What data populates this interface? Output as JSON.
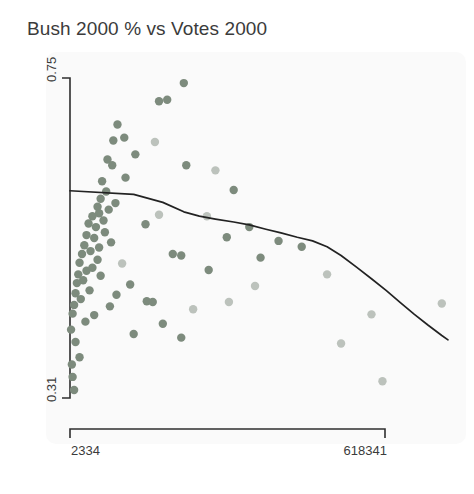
{
  "chart_data": {
    "type": "scatter",
    "title": "Bush 2000 % vs Votes 2000",
    "xlabel": "",
    "ylabel": "",
    "grid": false,
    "legend": false,
    "xlim": [
      2334,
      618341
    ],
    "ylim": [
      0.31,
      0.75
    ],
    "x_tick_labels": [
      "2334",
      "618341"
    ],
    "y_tick_labels": [
      "0.31",
      "0.75"
    ],
    "x_ticks": [
      2334,
      618341
    ],
    "y_ticks": [
      0.31,
      0.75
    ],
    "axis_color": "#2f2f2f",
    "background_color": "#fafafa",
    "point_colors": {
      "dark": "#7d8b7d",
      "light": "#bcc2bc"
    },
    "trend_line": {
      "name": "smoothed trend",
      "color": "#222222",
      "points": [
        [
          2334,
          0.595
        ],
        [
          12000,
          0.59
        ],
        [
          24000,
          0.579
        ],
        [
          38000,
          0.566
        ],
        [
          52000,
          0.56
        ],
        [
          70000,
          0.556
        ],
        [
          95000,
          0.552
        ],
        [
          120000,
          0.548
        ],
        [
          150000,
          0.542
        ],
        [
          180000,
          0.537
        ],
        [
          215000,
          0.531
        ],
        [
          250000,
          0.526
        ],
        [
          285000,
          0.518
        ],
        [
          320000,
          0.506
        ],
        [
          360000,
          0.49
        ],
        [
          400000,
          0.474
        ],
        [
          440000,
          0.458
        ],
        [
          480000,
          0.441
        ],
        [
          520000,
          0.425
        ],
        [
          560000,
          0.41
        ],
        [
          600000,
          0.396
        ],
        [
          618341,
          0.39
        ]
      ]
    },
    "series": [
      {
        "name": "counties",
        "points": [
          {
            "x": 38000,
            "y": 0.743,
            "shade": "dark"
          },
          {
            "x": 22000,
            "y": 0.718,
            "shade": "dark"
          },
          {
            "x": 26500,
            "y": 0.72,
            "shade": "dark"
          },
          {
            "x": 8000,
            "y": 0.686,
            "shade": "dark"
          },
          {
            "x": 9500,
            "y": 0.668,
            "shade": "dark"
          },
          {
            "x": 7200,
            "y": 0.664,
            "shade": "dark"
          },
          {
            "x": 20000,
            "y": 0.662,
            "shade": "light"
          },
          {
            "x": 12500,
            "y": 0.645,
            "shade": "dark"
          },
          {
            "x": 6200,
            "y": 0.638,
            "shade": "dark"
          },
          {
            "x": 7000,
            "y": 0.63,
            "shade": "dark"
          },
          {
            "x": 40000,
            "y": 0.63,
            "shade": "dark"
          },
          {
            "x": 70000,
            "y": 0.623,
            "shade": "light"
          },
          {
            "x": 9800,
            "y": 0.613,
            "shade": "dark"
          },
          {
            "x": 5400,
            "y": 0.608,
            "shade": "dark"
          },
          {
            "x": 95000,
            "y": 0.596,
            "shade": "dark"
          },
          {
            "x": 6000,
            "y": 0.594,
            "shade": "dark"
          },
          {
            "x": 5200,
            "y": 0.584,
            "shade": "dark"
          },
          {
            "x": 7600,
            "y": 0.578,
            "shade": "dark"
          },
          {
            "x": 4800,
            "y": 0.573,
            "shade": "dark"
          },
          {
            "x": 6400,
            "y": 0.569,
            "shade": "dark"
          },
          {
            "x": 5000,
            "y": 0.564,
            "shade": "dark"
          },
          {
            "x": 4200,
            "y": 0.56,
            "shade": "dark"
          },
          {
            "x": 22000,
            "y": 0.562,
            "shade": "light"
          },
          {
            "x": 60000,
            "y": 0.56,
            "shade": "light"
          },
          {
            "x": 5600,
            "y": 0.554,
            "shade": "dark"
          },
          {
            "x": 3800,
            "y": 0.55,
            "shade": "dark"
          },
          {
            "x": 16000,
            "y": 0.549,
            "shade": "dark"
          },
          {
            "x": 4600,
            "y": 0.545,
            "shade": "dark"
          },
          {
            "x": 120000,
            "y": 0.545,
            "shade": "dark"
          },
          {
            "x": 5800,
            "y": 0.538,
            "shade": "dark"
          },
          {
            "x": 3600,
            "y": 0.534,
            "shade": "dark"
          },
          {
            "x": 4400,
            "y": 0.53,
            "shade": "dark"
          },
          {
            "x": 85000,
            "y": 0.531,
            "shade": "dark"
          },
          {
            "x": 175000,
            "y": 0.526,
            "shade": "dark"
          },
          {
            "x": 6800,
            "y": 0.524,
            "shade": "dark"
          },
          {
            "x": 3400,
            "y": 0.52,
            "shade": "dark"
          },
          {
            "x": 5000,
            "y": 0.517,
            "shade": "dark"
          },
          {
            "x": 225000,
            "y": 0.518,
            "shade": "dark"
          },
          {
            "x": 4000,
            "y": 0.512,
            "shade": "dark"
          },
          {
            "x": 3200,
            "y": 0.508,
            "shade": "dark"
          },
          {
            "x": 30000,
            "y": 0.508,
            "shade": "dark"
          },
          {
            "x": 36000,
            "y": 0.506,
            "shade": "dark"
          },
          {
            "x": 140000,
            "y": 0.503,
            "shade": "dark"
          },
          {
            "x": 4800,
            "y": 0.5,
            "shade": "dark"
          },
          {
            "x": 3000,
            "y": 0.496,
            "shade": "dark"
          },
          {
            "x": 9000,
            "y": 0.495,
            "shade": "light"
          },
          {
            "x": 4200,
            "y": 0.489,
            "shade": "dark"
          },
          {
            "x": 3600,
            "y": 0.485,
            "shade": "dark"
          },
          {
            "x": 62000,
            "y": 0.486,
            "shade": "dark"
          },
          {
            "x": 2900,
            "y": 0.48,
            "shade": "dark"
          },
          {
            "x": 5200,
            "y": 0.478,
            "shade": "dark"
          },
          {
            "x": 285000,
            "y": 0.48,
            "shade": "light"
          },
          {
            "x": 3300,
            "y": 0.472,
            "shade": "dark"
          },
          {
            "x": 2800,
            "y": 0.468,
            "shade": "dark"
          },
          {
            "x": 11000,
            "y": 0.466,
            "shade": "dark"
          },
          {
            "x": 130000,
            "y": 0.464,
            "shade": "light"
          },
          {
            "x": 3900,
            "y": 0.458,
            "shade": "dark"
          },
          {
            "x": 2700,
            "y": 0.454,
            "shade": "dark"
          },
          {
            "x": 7800,
            "y": 0.452,
            "shade": "dark"
          },
          {
            "x": 3100,
            "y": 0.446,
            "shade": "dark"
          },
          {
            "x": 16500,
            "y": 0.443,
            "shade": "dark"
          },
          {
            "x": 19000,
            "y": 0.442,
            "shade": "dark"
          },
          {
            "x": 2600,
            "y": 0.438,
            "shade": "dark"
          },
          {
            "x": 6600,
            "y": 0.436,
            "shade": "dark"
          },
          {
            "x": 88000,
            "y": 0.442,
            "shade": "light"
          },
          {
            "x": 600000,
            "y": 0.44,
            "shade": "light"
          },
          {
            "x": 46000,
            "y": 0.432,
            "shade": "light"
          },
          {
            "x": 2500,
            "y": 0.426,
            "shade": "dark"
          },
          {
            "x": 4400,
            "y": 0.424,
            "shade": "dark"
          },
          {
            "x": 400000,
            "y": 0.425,
            "shade": "light"
          },
          {
            "x": 3500,
            "y": 0.415,
            "shade": "dark"
          },
          {
            "x": 24000,
            "y": 0.412,
            "shade": "dark"
          },
          {
            "x": 2400,
            "y": 0.404,
            "shade": "dark"
          },
          {
            "x": 12000,
            "y": 0.398,
            "shade": "dark"
          },
          {
            "x": 36000,
            "y": 0.393,
            "shade": "dark"
          },
          {
            "x": 2700,
            "y": 0.387,
            "shade": "dark"
          },
          {
            "x": 320000,
            "y": 0.385,
            "shade": "light"
          },
          {
            "x": 3000,
            "y": 0.366,
            "shade": "dark"
          },
          {
            "x": 2450,
            "y": 0.356,
            "shade": "dark"
          },
          {
            "x": 2500,
            "y": 0.339,
            "shade": "dark"
          },
          {
            "x": 430000,
            "y": 0.333,
            "shade": "light"
          },
          {
            "x": 2600,
            "y": 0.321,
            "shade": "dark"
          }
        ]
      }
    ]
  }
}
